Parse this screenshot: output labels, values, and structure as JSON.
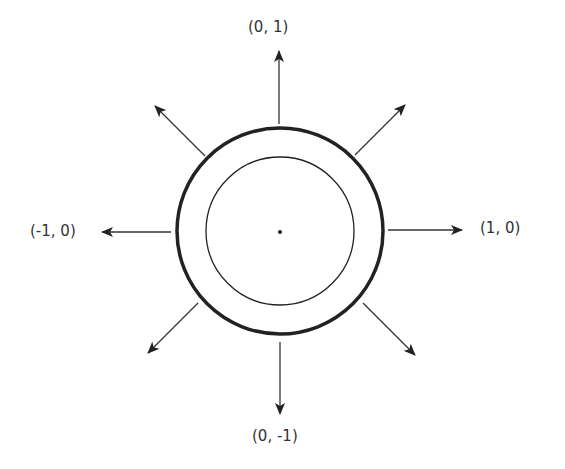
{
  "diagram": {
    "center": {
      "x": 280,
      "y": 231
    },
    "outer_circle_radius": 103,
    "inner_circle_radius": 74,
    "stroke_color": "#222222",
    "labels": {
      "top": "(0, 1)",
      "bottom": "(0, -1)",
      "left": "(-1, 0)",
      "right": "(1, 0)"
    },
    "arrows": [
      "up",
      "down",
      "left",
      "right",
      "up-left",
      "up-right",
      "down-left",
      "down-right"
    ]
  }
}
